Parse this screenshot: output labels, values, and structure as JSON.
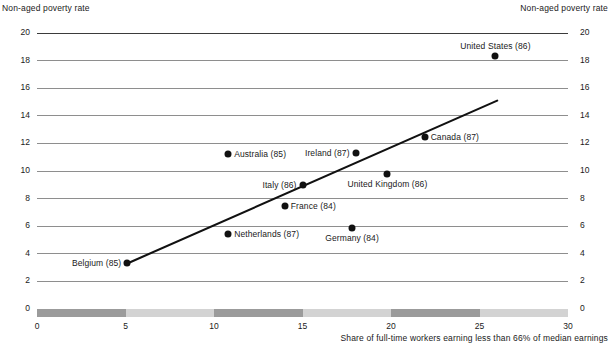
{
  "chart_data": {
    "type": "scatter",
    "title": "",
    "xlabel": "Share of full-time workers earning less than 66% of median earnings",
    "ylabel_left": "Non-aged poverty rate",
    "ylabel_right": "Non-aged poverty rate",
    "xlim": [
      0,
      30
    ],
    "ylim": [
      0,
      20
    ],
    "xticks": [
      0,
      5,
      10,
      15,
      20,
      25,
      30
    ],
    "yticks": [
      0,
      2,
      4,
      6,
      8,
      10,
      12,
      14,
      16,
      18,
      20
    ],
    "xtick_labels": [
      "0",
      "5",
      "10",
      "15",
      "20",
      "25",
      "30"
    ],
    "ytick_labels": [
      "0",
      "2",
      "4",
      "6",
      "8",
      "10",
      "12",
      "14",
      "16",
      "18",
      "20"
    ],
    "grid": true,
    "legend": "none",
    "points": [
      {
        "label": "Belgium (85)",
        "x": 5.1,
        "y": 3.3,
        "label_pos": "left"
      },
      {
        "label": "Netherlands (87)",
        "x": 10.8,
        "y": 5.4,
        "label_pos": "right"
      },
      {
        "label": "Australia (85)",
        "x": 10.8,
        "y": 11.2,
        "label_pos": "right"
      },
      {
        "label": "France (84)",
        "x": 14.0,
        "y": 7.5,
        "label_pos": "right"
      },
      {
        "label": "Italy (86)",
        "x": 15.0,
        "y": 9.0,
        "label_pos": "left"
      },
      {
        "label": "Germany (84)",
        "x": 17.8,
        "y": 5.9,
        "label_pos": "below"
      },
      {
        "label": "Ireland (87)",
        "x": 18.0,
        "y": 11.3,
        "label_pos": "left"
      },
      {
        "label": "United Kingdom (86)",
        "x": 19.8,
        "y": 9.8,
        "label_pos": "below"
      },
      {
        "label": "Canada (87)",
        "x": 21.9,
        "y": 12.5,
        "label_pos": "right"
      },
      {
        "label": "United States (86)",
        "x": 25.9,
        "y": 18.3,
        "label_pos": "above"
      }
    ],
    "trendline": {
      "x0": 5.1,
      "y0": 3.3,
      "x1": 26.0,
      "y1": 15.1
    },
    "xaxis_bands": [
      {
        "from": 0,
        "to": 5,
        "shade": "dark"
      },
      {
        "from": 5,
        "to": 10,
        "shade": "light"
      },
      {
        "from": 10,
        "to": 15,
        "shade": "dark"
      },
      {
        "from": 15,
        "to": 20,
        "shade": "light"
      },
      {
        "from": 20,
        "to": 25,
        "shade": "dark"
      },
      {
        "from": 25,
        "to": 30,
        "shade": "light"
      }
    ],
    "colors": {
      "dot": "#111111",
      "trendline": "#111111",
      "gridline": "#8e8e8e",
      "band_dark": "#9b9b9b",
      "band_light": "#d3d3d3",
      "text": "#1a1a1a"
    }
  }
}
